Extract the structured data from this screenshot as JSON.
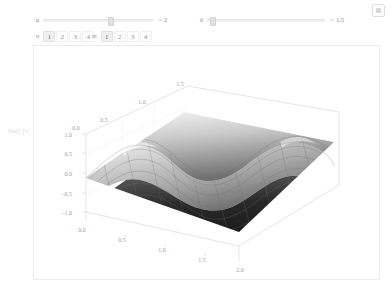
{
  "window": {
    "bookmark_icon": "bookmark-icon"
  },
  "controls": {
    "sliders": [
      {
        "label": "a",
        "value_display": "2",
        "equals": "=",
        "handle_percent": 59
      },
      {
        "label": "b",
        "value_display": "1.5",
        "equals": "=",
        "handle_percent": 2
      }
    ],
    "setter_bars": [
      {
        "label": "n",
        "options": [
          "1",
          "2",
          "3",
          "4"
        ],
        "selected": "1"
      },
      {
        "label": "m",
        "options": [
          "1",
          "2",
          "3",
          "4"
        ],
        "selected": "1"
      }
    ]
  },
  "output": {
    "label": "Out[ ]="
  },
  "chart_data": {
    "type": "surface3d",
    "title": "",
    "xlabel": "",
    "ylabel": "",
    "zlabel": "",
    "grid": true,
    "legend": false,
    "colormap": "grayscale",
    "axes": {
      "bottom_front": {
        "name": "x",
        "ticks": [
          "0.0",
          "0.5",
          "1.0",
          "1.5",
          "2.0"
        ],
        "range": [
          0.0,
          2.0
        ]
      },
      "depth_top": {
        "name": "y",
        "ticks": [
          "0.5",
          "1.0",
          "1.5"
        ],
        "range": [
          0.0,
          1.5
        ]
      },
      "vertical_left": {
        "name": "z",
        "ticks": [
          "1.0",
          "0.5",
          "0.0",
          "-0.5",
          "-1.0"
        ],
        "range": [
          -1.0,
          1.0
        ]
      }
    },
    "surface_shading": {
      "light": "#f2f2f2",
      "mid": "#9a9a9a",
      "dark": "#1d1d1d"
    }
  }
}
